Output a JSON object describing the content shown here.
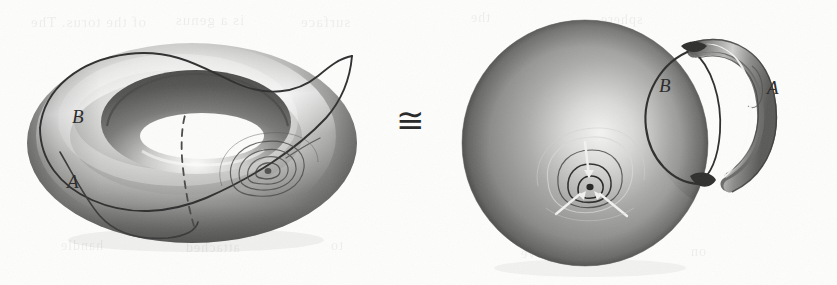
{
  "figure": {
    "kind": "mathematical-illustration",
    "caption_visible": false,
    "background_color": "#fdfdfc",
    "ink_color": "#2a2a2a",
    "surface_light": "#f2f2f0",
    "surface_mid": "#9a9a98",
    "surface_dark": "#4e4e4e",
    "relation_symbol": "≅"
  },
  "left_object": {
    "name": "torus",
    "labels": [
      {
        "id": "B",
        "text": "B",
        "x": 72,
        "y": 118,
        "curve": "longitude"
      },
      {
        "id": "A",
        "text": "A",
        "x": 67,
        "y": 183,
        "curve": "meridian"
      }
    ],
    "curves": [
      {
        "id": "B",
        "style": "solid",
        "role": "longitudinal generator"
      },
      {
        "id": "A",
        "style": "solid-with-hidden-dashed",
        "role": "meridional generator"
      }
    ],
    "marking": {
      "name": "critical-point-contours",
      "type": "nested-level-sets",
      "ring_count": 4,
      "has_radial_spoke": true,
      "x": 258,
      "y": 176
    }
  },
  "right_object": {
    "name": "sphere-with-handle",
    "labels": [
      {
        "id": "B",
        "text": "B",
        "x": 659,
        "y": 86,
        "curve": "loop on sphere"
      },
      {
        "id": "A",
        "text": "A",
        "x": 767,
        "y": 88,
        "curve": "loop through handle"
      }
    ],
    "handle": {
      "name": "handle-tube",
      "attachment_points": 2,
      "top_joint": {
        "x": 695,
        "y": 47
      },
      "bottom_joint": {
        "x": 700,
        "y": 182
      }
    },
    "marking": {
      "name": "critical-point-contours",
      "type": "nested-level-sets-with-trivalent-graph",
      "ring_count": 4,
      "spoke_count": 3,
      "x": 591,
      "y": 193
    }
  },
  "relation": {
    "name": "homeomorphic-to",
    "symbol": "≅",
    "x": 398,
    "y": 122
  },
  "show_through_text": {
    "note": "faint mirrored text bleeding through from the reverse side of the page",
    "lines": [
      {
        "text": "of the torus. The",
        "x": 30,
        "y": 14,
        "size": 15
      },
      {
        "text": "is a genus",
        "x": 175,
        "y": 12,
        "size": 15
      },
      {
        "text": "surface",
        "x": 300,
        "y": 14,
        "size": 15
      },
      {
        "text": "handle",
        "x": 60,
        "y": 238,
        "size": 14
      },
      {
        "text": "attached",
        "x": 185,
        "y": 240,
        "size": 14
      },
      {
        "text": "to",
        "x": 330,
        "y": 238,
        "size": 14
      },
      {
        "text": "the",
        "x": 470,
        "y": 10,
        "size": 14
      },
      {
        "text": "sphere",
        "x": 600,
        "y": 12,
        "size": 14
      },
      {
        "text": "curve",
        "x": 520,
        "y": 246,
        "size": 14
      },
      {
        "text": "on",
        "x": 690,
        "y": 244,
        "size": 14
      }
    ]
  }
}
